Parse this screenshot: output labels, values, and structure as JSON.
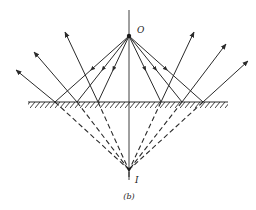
{
  "figure": {
    "caption": "(b)",
    "object_label": "O",
    "image_label": "I",
    "colors": {
      "line": "#2a2a2a",
      "background": "#ffffff"
    }
  },
  "geometry": {
    "object": {
      "x": 129,
      "y": 36
    },
    "image": {
      "x": 129,
      "y": 170
    },
    "mirror": {
      "x1": 28,
      "x2": 228,
      "y": 102
    },
    "axis": {
      "y_top": 10,
      "y_bottom": 180
    },
    "reflection_points_x": [
      55,
      77,
      98,
      161,
      182,
      203
    ],
    "reflected_ray_tips": [
      {
        "x": 16,
        "y": 70
      },
      {
        "x": 34,
        "y": 52
      },
      {
        "x": 65,
        "y": 32
      },
      {
        "x": 194,
        "y": 32
      },
      {
        "x": 226,
        "y": 44
      },
      {
        "x": 248,
        "y": 61
      }
    ]
  }
}
